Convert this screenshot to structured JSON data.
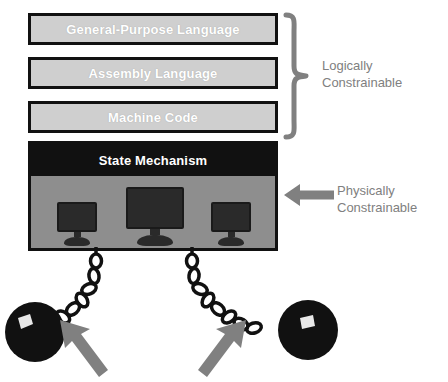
{
  "diagram": {
    "layers": [
      {
        "id": "general-purpose-language",
        "label": "General-Purpose Language"
      },
      {
        "id": "assembly-language",
        "label": "Assembly Language"
      },
      {
        "id": "machine-code",
        "label": "Machine Code"
      }
    ],
    "state_layer": {
      "id": "state-mechanism",
      "label": "State Mechanism"
    },
    "hardware": {
      "id": "hardware-panel",
      "monitor_count": 3,
      "monitors": [
        {
          "id": "monitor-left",
          "size": "small"
        },
        {
          "id": "monitor-center",
          "size": "large"
        },
        {
          "id": "monitor-right",
          "size": "small"
        }
      ]
    },
    "annotations": [
      {
        "id": "logical-annotation",
        "label": "Logically\nConstrainable",
        "marker": "curly-brace"
      },
      {
        "id": "physical-annotation",
        "label": "Physically\nConstrainable",
        "marker": "left-arrow"
      }
    ],
    "shackles": {
      "id": "ball-and-chain",
      "count": 2,
      "items": [
        {
          "id": "ball-chain-left"
        },
        {
          "id": "ball-chain-right"
        }
      ]
    },
    "emphasis_arrows": [
      {
        "id": "emphasis-arrow-left",
        "direction": "up-left"
      },
      {
        "id": "emphasis-arrow-right",
        "direction": "up-right"
      }
    ],
    "colors": {
      "layer_fill": "#cfcfcf",
      "layer_border": "#111111",
      "layer_text": "#ffffff",
      "state_fill": "#111111",
      "hardware_fill": "#8e8e8e",
      "annotation_text": "#808080",
      "annotation_marker": "#808080",
      "chain_stroke": "#111111",
      "ball_fill": "#111111",
      "ball_highlight": "#e8e8e8",
      "arrow_fill": "#808080",
      "background": "#ffffff"
    }
  }
}
